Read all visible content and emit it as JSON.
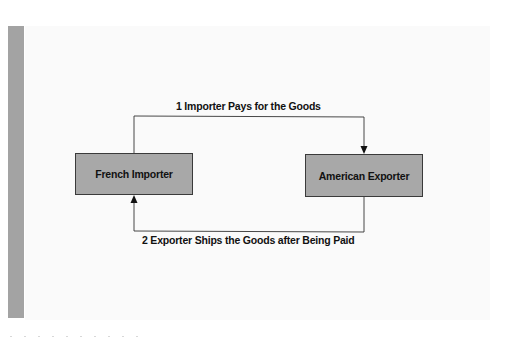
{
  "diagram": {
    "nodes": [
      {
        "id": "french-importer",
        "label": "French Importer"
      },
      {
        "id": "american-exporter",
        "label": "American Exporter"
      }
    ],
    "edges": [
      {
        "from": "french-importer",
        "to": "american-exporter",
        "label": "1 Importer Pays for the Goods",
        "route": "top"
      },
      {
        "from": "american-exporter",
        "to": "french-importer",
        "label": "2 Exporter Ships the Goods after Being Paid",
        "route": "bottom"
      }
    ]
  },
  "colors": {
    "box_fill": "#a8a8a8",
    "box_border": "#3a3a3a",
    "side_bar": "#a3a3a3",
    "panel": "#fafafa",
    "line": "#333333"
  }
}
